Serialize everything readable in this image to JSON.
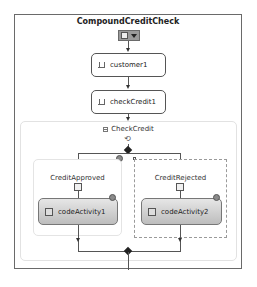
{
  "workflow": {
    "title": "CompoundCreditCheck",
    "header_icon": "document-icon",
    "header_menu_icon": "dropdown-arrow-icon"
  },
  "activities": [
    {
      "label": "customer1",
      "icon": "receive-activity-icon"
    },
    {
      "label": "checkCredit1",
      "icon": "receive-activity-icon"
    }
  ],
  "parallel": {
    "label": "CheckCredit",
    "collapse_icon": "minus-icon",
    "type_icon": "parallel-icon",
    "branches": [
      {
        "label": "CreditApproved",
        "icon": "sequence-icon",
        "child": {
          "label": "codeActivity1",
          "icon": "code-icon"
        }
      },
      {
        "label": "CreditRejected",
        "icon": "sequence-icon",
        "child": {
          "label": "codeActivity2",
          "icon": "code-icon"
        },
        "selected": true
      }
    ]
  },
  "colors": {
    "border": "#6a6a6a",
    "code_fill_top": "#e6e6e6",
    "code_fill_bottom": "#bdbdbd"
  }
}
